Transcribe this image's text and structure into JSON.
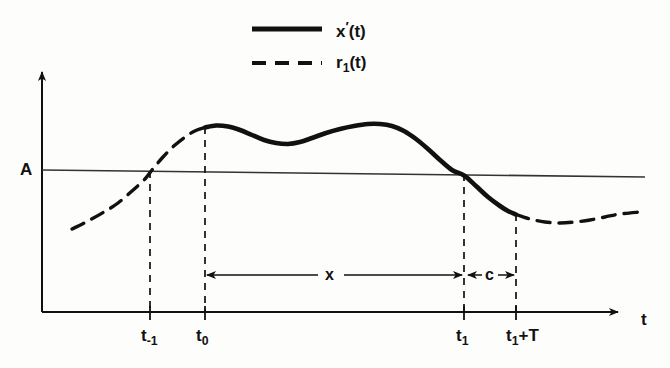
{
  "figure": {
    "title_visible": false,
    "background_color": "#fdfdfc",
    "ink_color": "#111111"
  },
  "legend": {
    "position": "top-center",
    "entries": [
      {
        "label_main": "x",
        "label_prime": "′",
        "label_arg": "(t)",
        "style": "solid",
        "name": "x-prime-of-t"
      },
      {
        "label_main": "r",
        "label_sub": "1",
        "label_arg": "(t)",
        "style": "dashed",
        "name": "r1-of-t"
      }
    ]
  },
  "axes": {
    "x_axis_label": "t",
    "y_axis_label": "",
    "threshold_label": "A",
    "x_tick_labels": [
      {
        "base": "t",
        "sub": "-1",
        "suffix": ""
      },
      {
        "base": "t",
        "sub": "0",
        "suffix": ""
      },
      {
        "base": "t",
        "sub": "1",
        "suffix": ""
      },
      {
        "base": "t",
        "sub": "1",
        "suffix": "+T"
      }
    ]
  },
  "dimensions": [
    {
      "label": "x",
      "from": "t_0",
      "to": "t_1"
    },
    {
      "label": "c",
      "from": "t_1",
      "to": "t_1+T"
    }
  ],
  "chart_data": {
    "type": "line",
    "title": "",
    "xlabel": "t",
    "ylabel": "",
    "grid": false,
    "legend_position": "top-center",
    "xlim": [
      0,
      670
    ],
    "ylim": [
      0,
      368
    ],
    "annotations": {
      "threshold_line": {
        "label": "A",
        "y_left": 170,
        "y_right": 177
      },
      "vertical_markers": [
        {
          "label": "t_-1",
          "x": 150,
          "y_top": 171,
          "y_bottom": 312
        },
        {
          "label": "t_0",
          "x": 205,
          "y_top": 127,
          "y_bottom": 312
        },
        {
          "label": "t_1",
          "x": 464,
          "y_top": 174,
          "y_bottom": 312
        },
        {
          "label": "t_1+T",
          "x": 516,
          "y_top": 214,
          "y_bottom": 312
        }
      ],
      "dimension_lines": [
        {
          "label": "x",
          "x_start": 205,
          "x_end": 466,
          "y": 275
        },
        {
          "label": "c",
          "x_start": 466,
          "x_end": 516,
          "y": 275
        }
      ]
    },
    "series": [
      {
        "name": "r_1(t) leading dashed segment",
        "style": "dashed",
        "points": [
          [
            72,
            229
          ],
          [
            88,
            221
          ],
          [
            104,
            212
          ],
          [
            118,
            203
          ],
          [
            132,
            191
          ],
          [
            145,
            179
          ],
          [
            152,
            170
          ],
          [
            163,
            157
          ],
          [
            175,
            145
          ],
          [
            188,
            135
          ],
          [
            197,
            130
          ],
          [
            205,
            127.5
          ]
        ]
      },
      {
        "name": "x'(t) solid segment",
        "style": "solid",
        "points": [
          [
            205,
            127.5
          ],
          [
            216,
            125.5
          ],
          [
            228,
            126.5
          ],
          [
            240,
            130
          ],
          [
            252,
            135
          ],
          [
            264,
            140
          ],
          [
            276,
            143
          ],
          [
            288,
            144
          ],
          [
            300,
            142
          ],
          [
            312,
            138
          ],
          [
            326,
            133
          ],
          [
            340,
            129
          ],
          [
            354,
            126
          ],
          [
            368,
            124
          ],
          [
            380,
            124
          ],
          [
            392,
            126
          ],
          [
            404,
            131
          ],
          [
            416,
            139
          ],
          [
            428,
            149
          ],
          [
            440,
            160
          ],
          [
            452,
            170
          ],
          [
            464,
            175.5
          ],
          [
            476,
            186
          ],
          [
            488,
            197
          ],
          [
            500,
            206
          ],
          [
            508,
            211
          ],
          [
            516,
            214.5
          ]
        ]
      },
      {
        "name": "r_1(t) trailing dashed segment",
        "style": "dashed",
        "points": [
          [
            516,
            214.5
          ],
          [
            530,
            219
          ],
          [
            545,
            222
          ],
          [
            560,
            223
          ],
          [
            575,
            222
          ],
          [
            590,
            220
          ],
          [
            605,
            217
          ],
          [
            620,
            214
          ],
          [
            640,
            212
          ]
        ]
      }
    ]
  }
}
